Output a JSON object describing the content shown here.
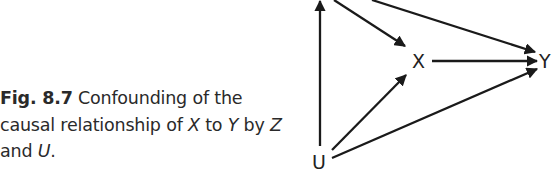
{
  "caption": {
    "label": "Fig. 8.7",
    "text_part1": " Confounding of the causal relationship of ",
    "var_x": "X",
    "text_part2": " to ",
    "var_y": "Y",
    "text_part3": " by ",
    "var_z": "Z",
    "text_part4": " and ",
    "var_u": "U",
    "text_part5": "."
  },
  "diagram": {
    "nodes": {
      "x": "X",
      "y": "Y",
      "u": "U"
    },
    "edges": [
      {
        "from": "U",
        "to": "Z"
      },
      {
        "from": "Z",
        "to": "X"
      },
      {
        "from": "Z",
        "to": "Y"
      },
      {
        "from": "X",
        "to": "Y"
      },
      {
        "from": "U",
        "to": "X"
      },
      {
        "from": "U",
        "to": "Y"
      }
    ],
    "colors": {
      "stroke": "#1a1a1a",
      "text": "#222222"
    }
  }
}
